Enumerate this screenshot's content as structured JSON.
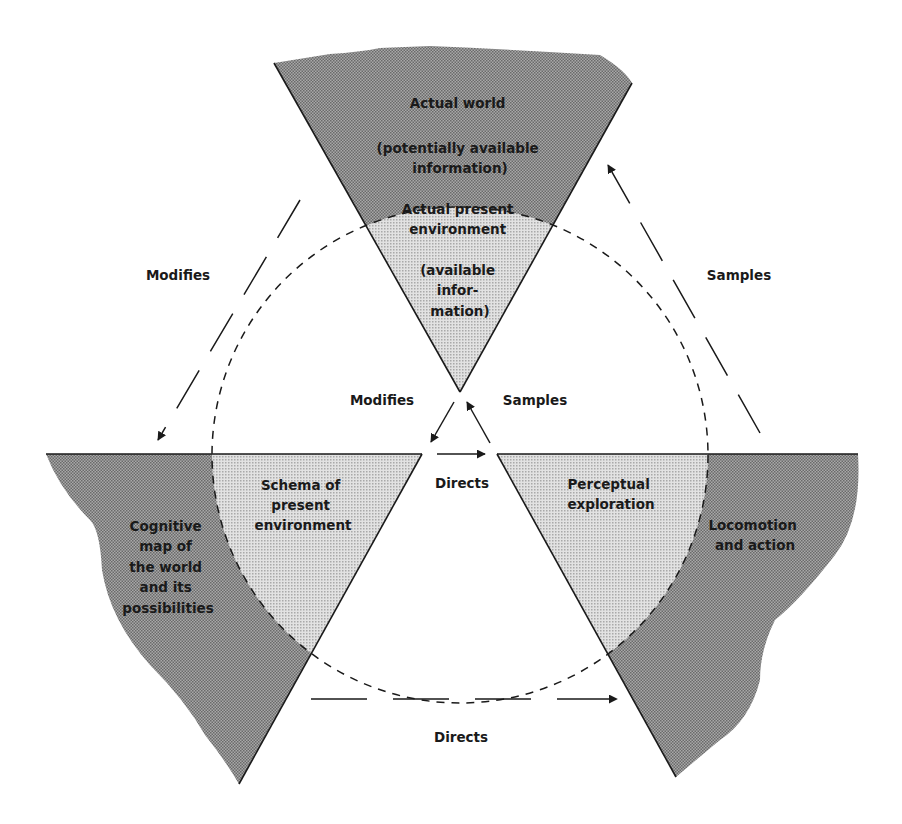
{
  "colors": {
    "dark_fill": "#8a8a8a",
    "light_fill": "#c9c9c9",
    "stroke": "#1a1a1a",
    "background": "#ffffff"
  },
  "regions": {
    "top_outer": {
      "lines": [
        "Actual world",
        "",
        "(potentially available",
        "information)"
      ]
    },
    "top_inner": {
      "lines": [
        "Actual present",
        "environment",
        "",
        "(available",
        "infor-",
        "mation)"
      ]
    },
    "left_inner": {
      "lines": [
        "Schema of",
        "present",
        "environment"
      ]
    },
    "left_outer": {
      "lines": [
        "Cognitive",
        "map of",
        "the world",
        "and its",
        "possibilities"
      ]
    },
    "right_inner": {
      "lines": [
        "Perceptual",
        "exploration"
      ]
    },
    "right_outer": {
      "lines": [
        "Locomotion",
        "and action"
      ]
    }
  },
  "arrows": {
    "outer_left": "Modifies",
    "outer_right": "Samples",
    "outer_bottom": "Directs",
    "inner_left": "Modifies",
    "inner_right": "Samples",
    "inner_bottom": "Directs"
  }
}
